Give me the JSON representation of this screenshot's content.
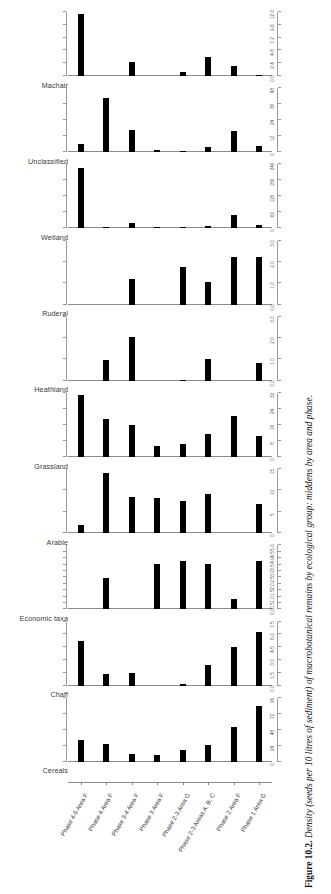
{
  "figure": {
    "caption_label": "Figure 10.2.",
    "caption_text": " Density (seeds per 10 litres of sediment) of macrobotanical remains by ecological group: middens by area and phase."
  },
  "axis": {
    "categories": [
      "Phase 4-5 Area F",
      "Phase 4 Area F",
      "Phase 3-4 Area F",
      "Phase 3 Area F",
      "Phase 2-3 Area G",
      "Phase 2-3 Areas A, B, C",
      "Phase 2 Area F",
      "Phase 1 Area G"
    ]
  },
  "chart_data": {
    "type": "bar",
    "title": "Density (seeds per 10 litres of sediment) of macrobotanical remains by ecological group: middens by area and phase.",
    "xlabel": "",
    "ylabel": "Density (seeds per 10 litres of sediment)",
    "grid": false,
    "legend": "none",
    "categories": [
      "Phase 4-5 Area F",
      "Phase 4 Area F",
      "Phase 3-4 Area F",
      "Phase 3 Area F",
      "Phase 2-3 Area G",
      "Phase 2-3 Areas A, B, C",
      "Phase 2 Area F",
      "Phase 1 Area G"
    ],
    "panels": [
      {
        "name": "Machair",
        "ticks": [
          "0.0",
          "2.4",
          "4.8",
          "7.2",
          "9.6",
          "12.0"
        ],
        "ylim": [
          0,
          12.0
        ],
        "values": [
          11.6,
          0.0,
          2.6,
          0.0,
          0.7,
          3.6,
          1.9,
          0.2
        ]
      },
      {
        "name": "Unclassified",
        "ticks": [
          "0",
          "12",
          "24",
          "36",
          "48"
        ],
        "ylim": [
          0,
          48
        ],
        "values": [
          6.0,
          41.0,
          17.0,
          1.5,
          1.0,
          4.0,
          16.0,
          5.0
        ]
      },
      {
        "name": "Wetland",
        "ticks": [
          "0",
          "60",
          "120",
          "180",
          "240"
        ],
        "ylim": [
          0,
          240
        ],
        "values": [
          228.0,
          4.0,
          22.0,
          5.0,
          4.0,
          9.0,
          52.0,
          12.0
        ]
      },
      {
        "name": "Ruderal",
        "ticks": [
          "0.0",
          "1.0",
          "2.0",
          "3.0"
        ],
        "ylim": [
          0,
          3.0
        ],
        "values": [
          0.0,
          0.0,
          1.22,
          0.0,
          1.75,
          1.05,
          2.22,
          2.25
        ]
      },
      {
        "name": "Heathland",
        "ticks": [
          "0.0",
          "1.0",
          "2.0",
          "3.0"
        ],
        "ylim": [
          0,
          3.0
        ],
        "values": [
          0.0,
          0.95,
          2.05,
          0.0,
          0.05,
          1.0,
          0.0,
          0.85
        ]
      },
      {
        "name": "Grassland",
        "ticks": [
          "0",
          "8",
          "16",
          "24",
          "32"
        ],
        "ylim": [
          0,
          32
        ],
        "values": [
          31.0,
          19.0,
          16.0,
          5.5,
          6.5,
          11.5,
          20.5,
          10.5
        ]
      },
      {
        "name": "Arable",
        "ticks": [
          "0",
          "5",
          "10",
          "15"
        ],
        "ylim": [
          0,
          15
        ],
        "values": [
          1.8,
          14.0,
          8.5,
          8.2,
          7.6,
          9.2,
          0.0,
          6.9
        ]
      },
      {
        "name": "Economic taxa",
        "ticks": [
          "0.0",
          "0.5",
          "1.0",
          "1.5",
          "2.0",
          "2.5",
          "3.0",
          "3.5",
          "4.0",
          "4.5",
          "5.0"
        ],
        "ylim": [
          0,
          5.0
        ],
        "values": [
          0.0,
          2.45,
          0.0,
          3.55,
          3.75,
          3.55,
          0.8,
          3.8
        ]
      },
      {
        "name": "Chaff",
        "ticks": [
          "0.0",
          "1.5",
          "3.0",
          "4.5",
          "6.0",
          "7.5"
        ],
        "ylim": [
          0,
          7.5
        ],
        "values": [
          5.2,
          1.4,
          1.5,
          0.0,
          0.15,
          2.4,
          4.5,
          6.3
        ]
      },
      {
        "name": "Cereals",
        "ticks": [
          "0",
          "24",
          "48",
          "72",
          "96"
        ],
        "ylim": [
          0,
          96
        ],
        "values": [
          33.0,
          27.0,
          11.0,
          10.0,
          18.0,
          25.0,
          52.0,
          84.0
        ]
      }
    ]
  }
}
